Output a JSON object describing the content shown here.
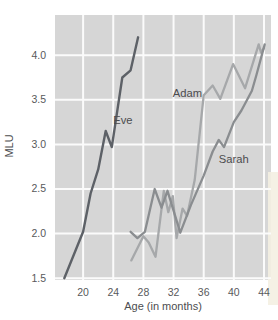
{
  "figure": {
    "plot_bg": "#d6d6d6",
    "grid_color": "#fbfbfb",
    "page_bg": "#ffffff",
    "cream_edge_color": "#f4efe2"
  },
  "chart_data": {
    "type": "line",
    "title": "",
    "xlabel": "Age (in months)",
    "ylabel": "MLU",
    "xlim": [
      16.27,
      44.93
    ],
    "ylim": [
      1.48,
      4.45
    ],
    "grid": true,
    "legend_position": "inline-labels",
    "x_ticks": [
      20,
      24,
      28,
      32,
      36,
      40,
      44
    ],
    "x_tick_labels": [
      "20",
      "24",
      "28",
      "32",
      "36",
      "40",
      "44"
    ],
    "y_ticks": [
      1.5,
      2.0,
      2.5,
      3.0,
      3.5,
      4.0
    ],
    "y_tick_labels": [
      "1.5",
      "2.0",
      "2.5",
      "3.0",
      "3.5",
      "4.0"
    ],
    "series": [
      {
        "name": "Adam",
        "color": "#a6a8aa",
        "stroke_width": 2.3,
        "label_anchor": {
          "age": 31.9,
          "mlu": 3.56
        },
        "points": [
          [
            26.4,
            1.7
          ],
          [
            28.0,
            1.97
          ],
          [
            28.7,
            1.9
          ],
          [
            29.6,
            1.74
          ],
          [
            30.7,
            2.48
          ],
          [
            31.3,
            2.24
          ],
          [
            31.9,
            2.42
          ],
          [
            32.4,
            1.95
          ],
          [
            33.2,
            2.28
          ],
          [
            33.8,
            2.2
          ],
          [
            34.8,
            2.6
          ],
          [
            36.0,
            3.55
          ],
          [
            37.2,
            3.66
          ],
          [
            38.2,
            3.51
          ],
          [
            39.9,
            3.9
          ],
          [
            41.5,
            3.63
          ],
          [
            43.3,
            4.12
          ],
          [
            43.6,
            4.03
          ],
          [
            44.0,
            4.08
          ]
        ]
      },
      {
        "name": "Sarah",
        "color": "#8a8d90",
        "stroke_width": 2.3,
        "label_anchor": {
          "age": 38.0,
          "mlu": 2.82
        },
        "points": [
          [
            26.3,
            2.02
          ],
          [
            27.2,
            1.95
          ],
          [
            28.2,
            2.02
          ],
          [
            29.5,
            2.5
          ],
          [
            30.4,
            2.29
          ],
          [
            31.2,
            2.48
          ],
          [
            32.9,
            2.01
          ],
          [
            34.3,
            2.32
          ],
          [
            36.0,
            2.65
          ],
          [
            37.2,
            2.92
          ],
          [
            38.0,
            3.05
          ],
          [
            38.7,
            2.97
          ],
          [
            40.0,
            3.25
          ],
          [
            41.0,
            3.38
          ],
          [
            42.4,
            3.6
          ],
          [
            43.0,
            3.78
          ],
          [
            44.1,
            4.12
          ]
        ]
      },
      {
        "name": "Eve",
        "color": "#5d6167",
        "stroke_width": 2.4,
        "label_anchor": {
          "age": 24.0,
          "mlu": 3.26
        },
        "points": [
          [
            17.5,
            1.5
          ],
          [
            20.0,
            2.02
          ],
          [
            21.0,
            2.45
          ],
          [
            22.0,
            2.72
          ],
          [
            23.0,
            3.15
          ],
          [
            23.8,
            2.97
          ],
          [
            25.2,
            3.75
          ],
          [
            26.3,
            3.83
          ],
          [
            27.3,
            4.2
          ]
        ]
      }
    ]
  }
}
